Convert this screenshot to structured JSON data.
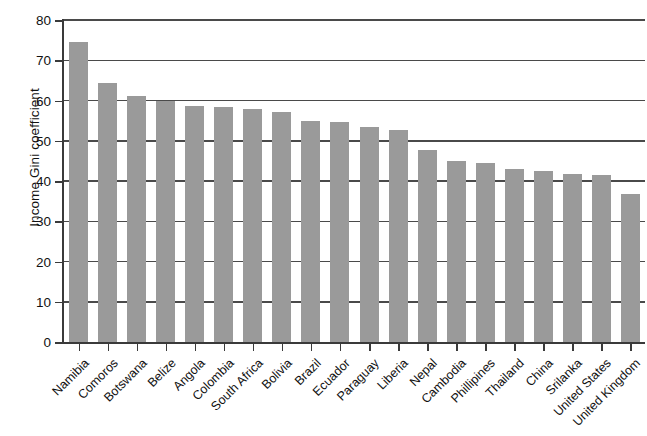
{
  "chart_data": {
    "type": "bar",
    "title": "",
    "xlabel": "",
    "ylabel": "Income Gini coefficient",
    "ylim": [
      0,
      80
    ],
    "yticks": [
      0,
      10,
      20,
      30,
      40,
      50,
      60,
      70,
      80
    ],
    "ytick_labels": [
      "0",
      "10",
      "20",
      "30",
      "40",
      "50",
      "60",
      "70",
      "80"
    ],
    "grid": "horizontal",
    "legend": "none",
    "bar_color": "#9a9a9a",
    "categories": [
      "Namibia",
      "Comoros",
      "Botswana",
      "Belize",
      "Angola",
      "Colombia",
      "South Africa",
      "Bolivia",
      "Brazil",
      "Ecuador",
      "Paraguay",
      "Liberia",
      "Nepal",
      "Cambodia",
      "Phillipines",
      "Thailand",
      "China",
      "Srilanka",
      "United States",
      "United Kingdom"
    ],
    "values": [
      74.6,
      64.3,
      61.0,
      59.9,
      58.6,
      58.5,
      57.8,
      57.2,
      55.0,
      54.6,
      53.5,
      52.6,
      47.6,
      44.9,
      44.5,
      43.0,
      42.5,
      41.7,
      41.5,
      36.8
    ]
  }
}
